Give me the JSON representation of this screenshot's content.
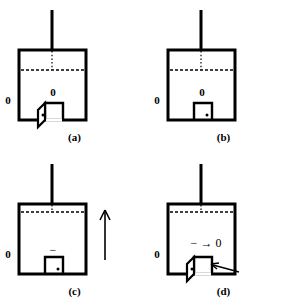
{
  "figure": {
    "type": "diagram",
    "background_color": "#ffffff",
    "line_color": "#000000",
    "panel_order": [
      "a",
      "b",
      "c",
      "d"
    ]
  },
  "panels": [
    {
      "id": "a",
      "caption": "(a)",
      "position": "top-left",
      "box": {
        "x": 19,
        "y": 50,
        "width": 67,
        "height": 70
      },
      "stem": {
        "x": 52,
        "y_top": 10,
        "y_bottom": 50
      },
      "level_line": {
        "style": "dashed",
        "y": 70,
        "label": "liquid-level"
      },
      "tick_line": {
        "style": "dotted",
        "x": 52,
        "y_top": 50,
        "y_bottom": 70
      },
      "door": {
        "state": "open",
        "swing": "outward-left",
        "handle": true
      },
      "labels": {
        "outside_left": "0",
        "inside": "0"
      }
    },
    {
      "id": "b",
      "caption": "(b)",
      "position": "top-right",
      "box": {
        "x": 168,
        "y": 50,
        "width": 67,
        "height": 70
      },
      "stem": {
        "x": 201,
        "y_top": 10,
        "y_bottom": 50
      },
      "level_line": {
        "style": "dashed",
        "y": 70,
        "label": "liquid-level"
      },
      "tick_line": {
        "style": "dotted",
        "x": 201,
        "y_top": 50,
        "y_bottom": 70
      },
      "door": {
        "state": "closed",
        "swing": "none",
        "handle": true
      },
      "labels": {
        "outside_left": "0",
        "inside": "0"
      }
    },
    {
      "id": "c",
      "caption": "(c)",
      "position": "bottom-left",
      "box": {
        "x": 19,
        "y": 204,
        "width": 67,
        "height": 70
      },
      "stem": {
        "x": 52,
        "y_top": 164,
        "y_bottom": 204
      },
      "level_line": {
        "style": "dashed",
        "y": 212,
        "label": "liquid-level-raised"
      },
      "tick_line": {
        "style": "dotted",
        "x": 52,
        "y_top": 204,
        "y_bottom": 212
      },
      "door": {
        "state": "closed",
        "swing": "none",
        "handle": true
      },
      "arrow_up": {
        "x": 105,
        "y_tail": 260,
        "y_head": 212,
        "direction": "up"
      },
      "labels": {
        "outside_left": "0",
        "inside": "−"
      }
    },
    {
      "id": "d",
      "caption": "(d)",
      "position": "bottom-right",
      "box": {
        "x": 168,
        "y": 204,
        "width": 67,
        "height": 70
      },
      "stem": {
        "x": 201,
        "y_top": 164,
        "y_bottom": 204
      },
      "level_line": {
        "style": "dashed",
        "y": 212,
        "label": "liquid-level-raised"
      },
      "tick_line": {
        "style": "dotted",
        "x": 201,
        "y_top": 204,
        "y_bottom": 212
      },
      "door": {
        "state": "open",
        "swing": "outward-left",
        "handle": true
      },
      "inflow_arrow": {
        "x_tail": 292,
        "x_head": 265,
        "y": 285,
        "direction": "left"
      },
      "labels": {
        "outside_left": "0",
        "inside": "− → 0"
      }
    }
  ]
}
